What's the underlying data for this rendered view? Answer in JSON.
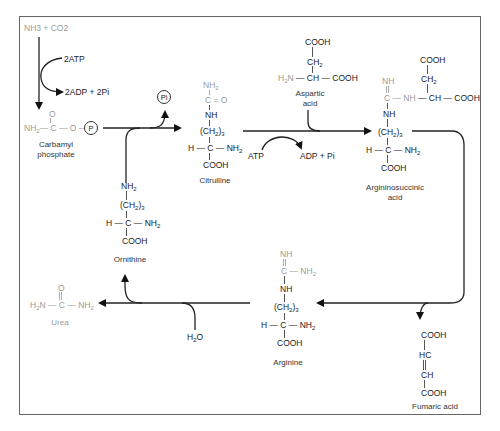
{
  "diagram": {
    "reactants_top": "NH3 + CO2",
    "atp_in": "2ATP",
    "adp_out": "2ADP + 2Pi",
    "pi_circle": "Pi",
    "p_circle": "P",
    "atp2_in": "ATP",
    "adp2_out": "ADP + Pi",
    "water": "H2O"
  },
  "molecules": {
    "carbamyl_phosphate": {
      "label_line1": "Carbamyl",
      "label_line2": "phosphate",
      "formula": "NH2—C—O—(P)",
      "carbonyl": "O"
    },
    "citrulline": {
      "label": "Citrulline",
      "lines": [
        "NH2",
        "C=O",
        "NH",
        "(CH2)3",
        "H—C—NH2",
        "COOH"
      ]
    },
    "aspartic_acid": {
      "label_line1": "Aspartic",
      "label_line2": "acid",
      "lines": [
        "COOH",
        "CH2",
        "H2N—CH—COOH"
      ]
    },
    "argininosuccinic_acid": {
      "label_line1": "Argininosuccinic",
      "label_line2": "acid",
      "lines": [
        "COOH",
        "NH",
        "CH2",
        "C—NH—CH—COOH",
        "NH",
        "(CH2)3",
        "H—C—NH2",
        "COOH"
      ]
    },
    "fumaric_acid": {
      "label": "Fumaric acid",
      "lines": [
        "COOH",
        "HC",
        "CH",
        "COOH"
      ]
    },
    "arginine": {
      "label": "Arginine",
      "lines": [
        "NH",
        "C—NH2",
        "NH",
        "(CH2)3",
        "H—C—NH2",
        "COOH"
      ]
    },
    "ornithine": {
      "label": "Ornithine",
      "lines": [
        "NH2",
        "(CH2)3",
        "H—C—NH2",
        "COOH"
      ]
    },
    "urea": {
      "label": "Urea",
      "formula": "H2N—C—NH2",
      "carbonyl": "O"
    }
  },
  "colors": {
    "line": "#222222",
    "faded": "#9a9a9a",
    "frame": "#666666"
  }
}
